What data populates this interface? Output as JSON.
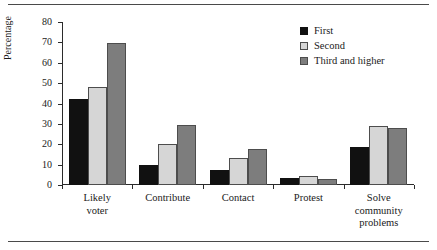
{
  "chart_data": {
    "type": "bar",
    "title": "",
    "subtitle": "",
    "xlabel": "",
    "ylabel": "Percentage",
    "ylim": [
      0,
      80
    ],
    "ytick_step": 10,
    "yticks": [
      0,
      10,
      20,
      30,
      40,
      50,
      60,
      70,
      80
    ],
    "grid": false,
    "legend_position": "top-right",
    "categories": [
      "Likely\nvoter",
      "Contribute",
      "Contact",
      "Protest",
      "Solve\ncommunity\nproblems"
    ],
    "series": [
      {
        "name": "First",
        "color": "#111111",
        "values": [
          42,
          10,
          7.5,
          3.5,
          18.5
        ]
      },
      {
        "name": "Second",
        "color": "#d6d6d6",
        "values": [
          48,
          20,
          13.5,
          4.5,
          29
        ]
      },
      {
        "name": "Third and higher",
        "color": "#7d7d7d",
        "values": [
          69.5,
          29.5,
          17.5,
          2.8,
          28
        ]
      }
    ]
  },
  "legend": {
    "items": [
      {
        "label": "First",
        "swatch": "#111111"
      },
      {
        "label": "Second",
        "swatch": "#d6d6d6"
      },
      {
        "label": "Third and higher",
        "swatch": "#7d7d7d"
      }
    ]
  },
  "axes": {
    "y_title": "Percentage",
    "y_tick_labels": [
      "80",
      "70",
      "60",
      "50",
      "40",
      "30",
      "20",
      "10",
      "0"
    ],
    "x_tick_labels": [
      "Likely\nvoter",
      "Contribute",
      "Contact",
      "Protest",
      "Solve\ncommunity\nproblems"
    ]
  }
}
